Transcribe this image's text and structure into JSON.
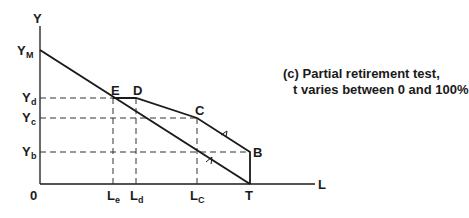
{
  "diagram": {
    "caption": {
      "line1": "(c)  Partial retirement test,",
      "line2": "t varies between 0 and 100%"
    },
    "axes": {
      "y_label": "Y",
      "x_label": "L",
      "origin_label": "0"
    },
    "y_ticks": [
      {
        "main": "Y",
        "sub": "M"
      },
      {
        "main": "Y",
        "sub": "d"
      },
      {
        "main": "Y",
        "sub": "c"
      },
      {
        "main": "Y",
        "sub": "b"
      }
    ],
    "x_ticks": [
      {
        "main": "L",
        "sub": "e"
      },
      {
        "main": "L",
        "sub": "d"
      },
      {
        "main": "L",
        "sub": "C"
      }
    ],
    "points": {
      "E": "E",
      "D": "D",
      "C": "C",
      "B": "B",
      "T": "T"
    },
    "colors": {
      "line": "#1a1a1a",
      "background": "#ffffff"
    }
  }
}
